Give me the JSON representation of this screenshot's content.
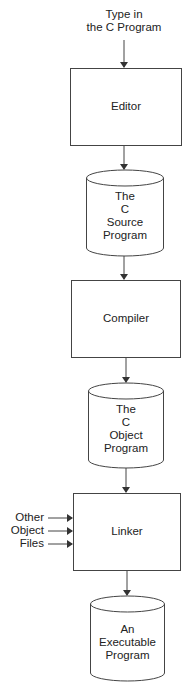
{
  "diagram": {
    "input_label": [
      "Type in",
      "the C Program"
    ],
    "nodes": [
      {
        "id": "editor",
        "shape": "rectangle",
        "label": [
          "Editor"
        ]
      },
      {
        "id": "source",
        "shape": "cylinder",
        "label": [
          "The",
          "C",
          "Source",
          "Program"
        ]
      },
      {
        "id": "compiler",
        "shape": "rectangle",
        "label": [
          "Compiler"
        ]
      },
      {
        "id": "object",
        "shape": "cylinder",
        "label": [
          "The",
          "C",
          "Object",
          "Program"
        ]
      },
      {
        "id": "linker",
        "shape": "rectangle",
        "label": [
          "Linker"
        ]
      },
      {
        "id": "executable",
        "shape": "cylinder",
        "label": [
          "An",
          "Executable",
          "Program"
        ]
      }
    ],
    "side_inputs": [
      "Other",
      "Object",
      "Files"
    ],
    "edges": [
      [
        "input",
        "editor"
      ],
      [
        "editor",
        "source"
      ],
      [
        "source",
        "compiler"
      ],
      [
        "compiler",
        "object"
      ],
      [
        "object",
        "linker"
      ],
      [
        "other-object-files",
        "linker"
      ],
      [
        "linker",
        "executable"
      ]
    ],
    "colors": {
      "stroke": "#333333",
      "background": "#ffffff"
    }
  }
}
